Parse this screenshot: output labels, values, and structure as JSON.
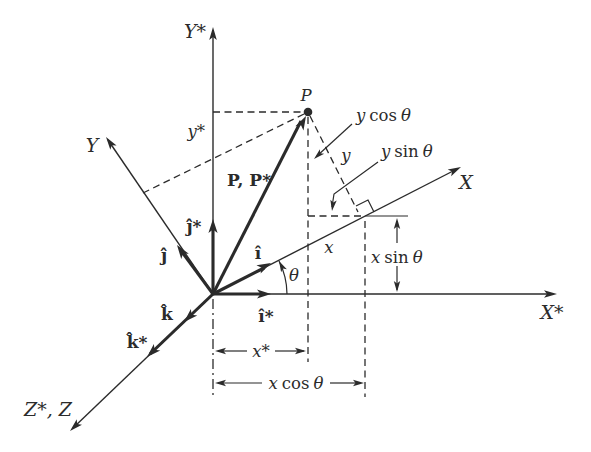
{
  "figure_type": "coordinate-rotation-diagram",
  "colors": {
    "ink": "#2b2b2b",
    "paper": "#ffffff"
  },
  "labels": {
    "y_star_axis": "Y*",
    "x_star_axis": "X*",
    "x_axis": "X",
    "y_axis": "Y",
    "z_axis": "Z*, Z",
    "point": "P",
    "position_vector": "P, P*",
    "y_star": "y*",
    "x_star": "x*",
    "x_coord": "x",
    "y_coord": "y",
    "theta": "θ",
    "x_cos": {
      "var": "x",
      "fn": "cos",
      "angle": "θ"
    },
    "x_sin": {
      "var": "x",
      "fn": "sin",
      "angle": "θ"
    },
    "y_cos": {
      "var": "y",
      "fn": "cos",
      "angle": "θ"
    },
    "y_sin": {
      "var": "y",
      "fn": "sin",
      "angle": "θ"
    },
    "i_hat": "î",
    "i_hat_star": "î*",
    "j_hat": "ĵ",
    "j_hat_star": "ĵ*",
    "k_hat": "k̂",
    "k_hat_star": "k̂*"
  }
}
